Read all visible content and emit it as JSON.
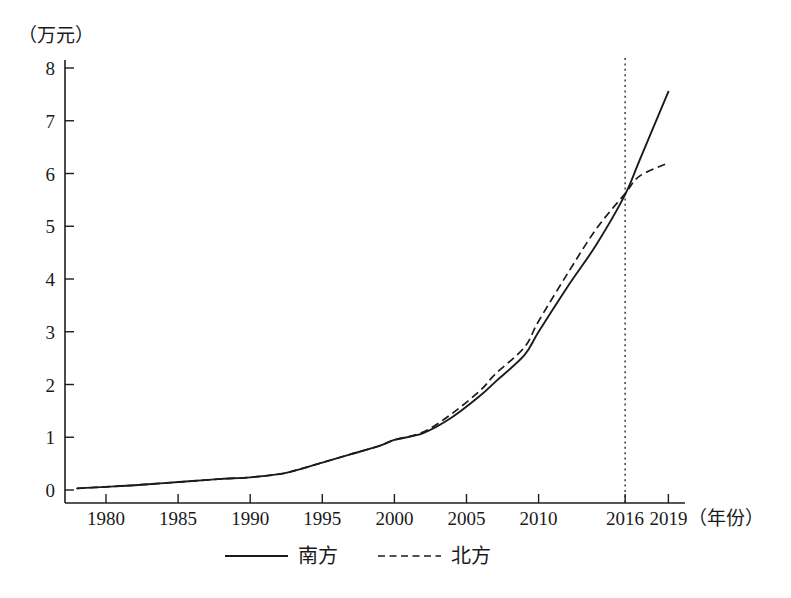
{
  "chart_data": {
    "type": "line",
    "title": "",
    "subtitle": "",
    "xlabel": "（年份）",
    "ylabel": "（万元）",
    "xlim": [
      1978,
      2019
    ],
    "ylim": [
      0,
      8
    ],
    "grid": false,
    "legend_position": "bottom-center",
    "x_tick_labels": [
      "1980",
      "1985",
      "1990",
      "1995",
      "2000",
      "2005",
      "2010",
      "2016",
      "2019"
    ],
    "x_tick_values": [
      1980,
      1985,
      1990,
      1995,
      2000,
      2005,
      2010,
      2016,
      2019
    ],
    "y_tick_labels": [
      "0",
      "1",
      "2",
      "3",
      "4",
      "5",
      "6",
      "7",
      "8"
    ],
    "y_tick_values": [
      0,
      1,
      2,
      3,
      4,
      5,
      6,
      7,
      8
    ],
    "annotations": [
      {
        "name": "reference-line-2016",
        "type": "vline",
        "x": 2016,
        "style": "dotted"
      }
    ],
    "series": [
      {
        "name": "南方",
        "style": "solid",
        "x": [
          1978,
          1980,
          1982,
          1984,
          1986,
          1988,
          1990,
          1992,
          1993,
          1995,
          1997,
          1999,
          2000,
          2002,
          2004,
          2006,
          2007,
          2009,
          2010,
          2012,
          2014,
          2016,
          2017,
          2019
        ],
        "values": [
          0.03,
          0.06,
          0.09,
          0.13,
          0.17,
          0.21,
          0.24,
          0.3,
          0.36,
          0.52,
          0.68,
          0.84,
          0.95,
          1.08,
          1.38,
          1.8,
          2.05,
          2.55,
          3.0,
          3.85,
          4.65,
          5.6,
          6.25,
          7.55
        ]
      },
      {
        "name": "北方",
        "style": "dashed",
        "x": [
          1978,
          1980,
          1982,
          1984,
          1986,
          1988,
          1990,
          1992,
          1993,
          1995,
          1997,
          1999,
          2000,
          2002,
          2004,
          2006,
          2007,
          2009,
          2010,
          2012,
          2014,
          2016,
          2017,
          2019
        ],
        "values": [
          0.03,
          0.06,
          0.09,
          0.13,
          0.17,
          0.21,
          0.24,
          0.3,
          0.36,
          0.52,
          0.68,
          0.84,
          0.95,
          1.1,
          1.45,
          1.9,
          2.2,
          2.7,
          3.2,
          4.1,
          4.95,
          5.62,
          5.95,
          6.2
        ]
      }
    ]
  },
  "legend": {
    "items": [
      {
        "label": "南方",
        "style": "solid"
      },
      {
        "label": "北方",
        "style": "dashed"
      }
    ]
  },
  "axes": {
    "y_unit_label": "（万元）",
    "x_unit_label": "（年份）"
  }
}
